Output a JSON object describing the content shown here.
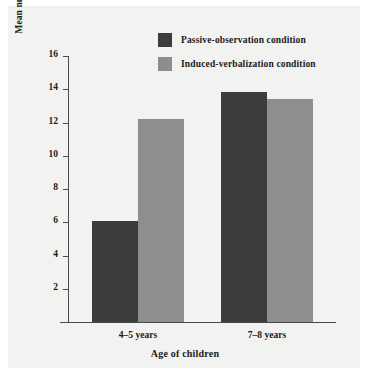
{
  "chart_data": {
    "type": "bar",
    "title": "",
    "subtitle": "",
    "xlabel": "Age of children",
    "ylabel": "Mean number of responses correctly reproduced",
    "categories": [
      "4–5 years",
      "7–8 years"
    ],
    "series": [
      {
        "name": "Passive-observation condition",
        "values": [
          6.1,
          13.85
        ],
        "color": "#3c3c3c"
      },
      {
        "name": "Induced-verbalization condition",
        "values": [
          12.2,
          13.4
        ],
        "color": "#8e8e8e"
      }
    ],
    "ylim": [
      0,
      16
    ],
    "yticks": [
      2,
      4,
      6,
      8,
      10,
      12,
      14,
      16
    ],
    "ytick_labels": [
      "2",
      "4",
      "6",
      "8",
      "10",
      "12",
      "14",
      "16"
    ],
    "grid": false,
    "legend_position": "top-center"
  },
  "legend": {
    "items": [
      {
        "label": "Passive-observation condition",
        "color": "#3c3c3c"
      },
      {
        "label": "Induced-verbalization condition",
        "color": "#8e8e8e"
      }
    ]
  },
  "colors": {
    "panel_background": "#f2f2f0",
    "page_background": "#ffffff",
    "axis": "#4a4a4a",
    "text": "#1a1a1a",
    "series_dark": "#3c3c3c",
    "series_light": "#8e8e8e"
  }
}
